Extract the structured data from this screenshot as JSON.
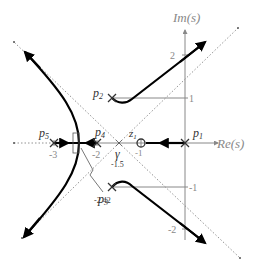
{
  "diagram": {
    "type": "root-locus",
    "axes": {
      "x_label": "Re(s)",
      "y_label": "Im(s)",
      "x_ticks": [
        {
          "value": -3,
          "label": "-3"
        },
        {
          "value": -2,
          "label": "-2"
        },
        {
          "value": -1,
          "label": "-1"
        }
      ],
      "y_ticks": [
        {
          "value": 2,
          "label": "2"
        },
        {
          "value": 1,
          "label": "1"
        },
        {
          "value": -1,
          "label": "-1"
        },
        {
          "value": -2,
          "label": "-2"
        }
      ]
    },
    "poles": [
      {
        "id": "p1",
        "label": "p",
        "sub": "1",
        "re": 0,
        "im": 0
      },
      {
        "id": "p2",
        "label": "p",
        "sub": "2",
        "re": -1.5,
        "im": 1
      },
      {
        "id": "p3",
        "label": "p",
        "sub": "3",
        "re": -1.5,
        "im": -1
      },
      {
        "id": "p4",
        "label": "p",
        "sub": "4",
        "re": -2,
        "im": 0
      },
      {
        "id": "p5",
        "label": "p",
        "sub": "5",
        "re": -3,
        "im": 0
      }
    ],
    "zeros": [
      {
        "id": "z1",
        "label": "z",
        "sub": "1",
        "re": -1,
        "im": 0
      }
    ],
    "centroid": {
      "label": "γ",
      "value_label": "-1.5",
      "re": -1.5
    },
    "breakaway": {
      "value_label": "-2.42",
      "re": -2.42
    }
  }
}
